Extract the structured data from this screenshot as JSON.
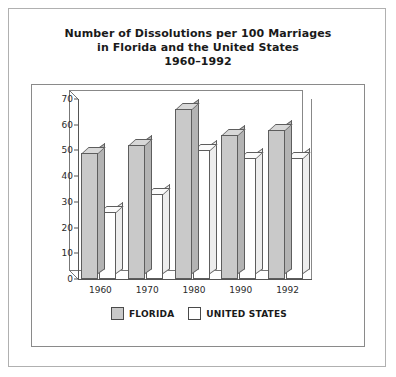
{
  "title": {
    "line1": "Number of Dissolutions per 100 Marriages",
    "line2": "in Florida and the United States",
    "line3": "1960–1992"
  },
  "legend": {
    "florida": "FLORIDA",
    "united_states": "UNITED STATES"
  },
  "source_note": "Source: Florida Department of Health and Rehabilitative Services, Office of Vital Statistics.",
  "colors": {
    "florida_fill": "#c9c9c9",
    "united_states_fill": "#ffffff",
    "bar_outline": "#5d5d5d",
    "frame": "#8a8a8a",
    "page_border": "#b0b0b0",
    "text": "#1a1a1a",
    "source_text": "#6a6a6a"
  },
  "chart_data": {
    "type": "bar",
    "title": "Number of Dissolutions per 100 Marriages in Florida and the United States 1960–1992",
    "xlabel": "",
    "ylabel": "",
    "categories": [
      "1960",
      "1970",
      "1980",
      "1990",
      "1992"
    ],
    "series": [
      {
        "name": "FLORIDA",
        "values": [
          49,
          52,
          66,
          56,
          58
        ]
      },
      {
        "name": "UNITED STATES",
        "values": [
          26,
          33,
          50,
          47,
          47
        ]
      }
    ],
    "ylim": [
      0,
      70
    ],
    "yticks": [
      0,
      10,
      20,
      30,
      40,
      50,
      60,
      70
    ],
    "ytick_labels": [
      "0",
      "10",
      "20",
      "30",
      "40",
      "50",
      "60",
      "70"
    ],
    "grid": false,
    "legend_position": "bottom",
    "style": "3d-bars"
  }
}
